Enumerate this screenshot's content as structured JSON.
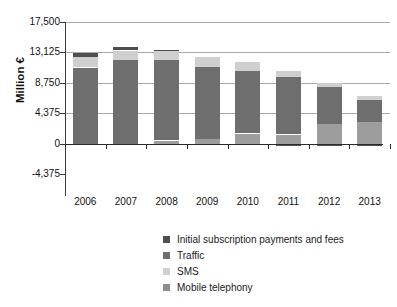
{
  "chart_data": {
    "type": "bar",
    "subtype": "stacked-bar",
    "title": "",
    "xlabel": "",
    "ylabel": "Million €",
    "ylim": [
      -4375,
      17500
    ],
    "yticks": [
      -4375,
      0,
      4375,
      8750,
      13125,
      17500
    ],
    "ytick_labels": [
      "-4,375",
      "0",
      "4,375",
      "8,750",
      "13,125",
      "17,500"
    ],
    "grid": true,
    "legend_position": "bottom-center",
    "categories": [
      "2006",
      "2007",
      "2008",
      "2009",
      "2010",
      "2011",
      "2012",
      "2013"
    ],
    "series": [
      {
        "name": "Mobile telephony",
        "color": "#9d9d9d",
        "values": [
          0,
          0,
          450,
          600,
          1450,
          1300,
          2900,
          3100
        ]
      },
      {
        "name": "Traffic",
        "color": "#6e6e6e",
        "values": [
          10950,
          12050,
          11550,
          10400,
          9050,
          8250,
          5250,
          3200
        ]
      },
      {
        "name": "SMS",
        "color": "#cfcfcf",
        "values": [
          1550,
          1350,
          1350,
          1400,
          1200,
          900,
          550,
          600
        ]
      },
      {
        "name": "Initial subscription payments and fees",
        "color": "#4f4f4f",
        "values": [
          480,
          480,
          150,
          -200,
          -250,
          -350,
          -300,
          -380
        ]
      }
    ]
  },
  "axis": {
    "y_title": "Million €"
  },
  "legend": {
    "items": [
      {
        "label": "Initial subscription payments and fees",
        "color": "#4f4f4f"
      },
      {
        "label": "Traffic",
        "color": "#6e6e6e"
      },
      {
        "label": "SMS",
        "color": "#cfcfcf"
      },
      {
        "label": "Mobile telephony",
        "color": "#8c8c8c"
      }
    ]
  },
  "colors": {
    "grid": "#a9a9a9",
    "axis": "#2b2b2b",
    "background": "#ffffff",
    "text": "#111111"
  }
}
